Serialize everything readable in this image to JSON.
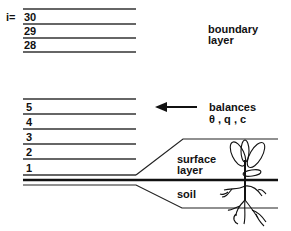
{
  "diagram": {
    "level_prefix": "i=",
    "upper_levels": [
      "30",
      "29",
      "28"
    ],
    "lower_levels": [
      "5",
      "4",
      "3",
      "2",
      "1"
    ],
    "boundary_label": [
      "boundary",
      "layer"
    ],
    "balances_label": [
      "balances",
      "θ , q , c"
    ],
    "surface_label": [
      "surface",
      "layer"
    ],
    "soil_label": "soil",
    "arrow": "left-arrow",
    "line_color": "#222222"
  }
}
